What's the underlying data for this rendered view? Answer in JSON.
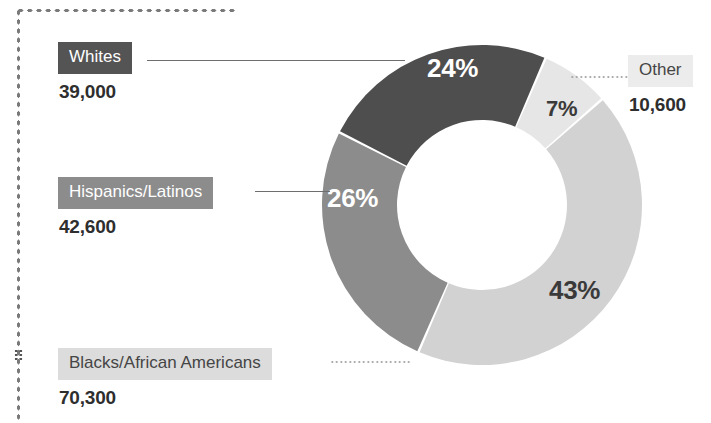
{
  "chart_data": {
    "type": "pie",
    "variant": "donut",
    "title": "",
    "xlabel": "",
    "ylabel": "",
    "legend_position": "callout-labels",
    "grid": false,
    "start_angle_deg": -63,
    "direction": "clockwise",
    "categories": [
      "Whites",
      "Other",
      "Blacks/African Americans",
      "Hispanics/Latinos"
    ],
    "values": [
      24,
      7,
      43,
      26
    ],
    "value_unit": "percent",
    "counts": [
      39000,
      10600,
      70300,
      42600
    ],
    "slices": [
      {
        "name": "Whites",
        "percent": 24,
        "percent_label": "24%",
        "count_label": "39,000",
        "color": "#4e4e4e",
        "chip_background": "#545454",
        "chip_text_color": "#ffffff",
        "pct_text_color": "#ffffff",
        "leader_style": "solid"
      },
      {
        "name": "Other",
        "percent": 7,
        "percent_label": "7%",
        "count_label": "10,600",
        "color": "#e6e6e6",
        "chip_background": "#ececec",
        "chip_text_color": "#454545",
        "pct_text_color": "#3a3a3a",
        "leader_style": "dotted"
      },
      {
        "name": "Blacks/African Americans",
        "percent": 43,
        "percent_label": "43%",
        "count_label": "70,300",
        "color": "#d2d2d2",
        "chip_background": "#dcdcdc",
        "chip_text_color": "#454545",
        "pct_text_color": "#3a3a3a",
        "leader_style": "dotted"
      },
      {
        "name": "Hispanics/Latinos",
        "percent": 26,
        "percent_label": "26%",
        "count_label": "42,600",
        "color": "#8c8c8c",
        "chip_background": "#8c8c8c",
        "chip_text_color": "#ffffff",
        "pct_text_color": "#ffffff",
        "leader_style": "solid"
      }
    ],
    "geometry": {
      "center_x": 482,
      "center_y": 205,
      "outer_radius": 160,
      "inner_radius": 85
    }
  },
  "frame": {
    "border_color": "#7a7a7a",
    "border_style": "dotted"
  },
  "background_color": "#ffffff"
}
